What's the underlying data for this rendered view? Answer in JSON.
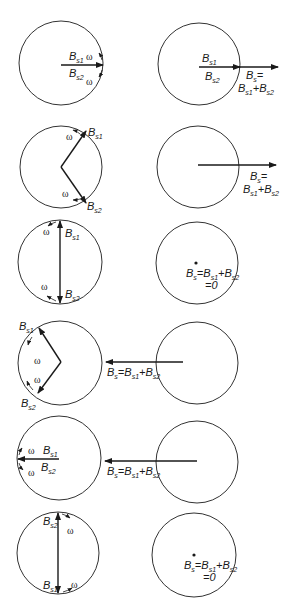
{
  "figure": {
    "labels": {
      "b": "B",
      "s": "s",
      "s1": "s1",
      "s2": "s2",
      "plus": "+",
      "eq": "=",
      "zero": "=0",
      "omega": "ω"
    },
    "rows": [
      {
        "index": 1,
        "left_state": "Bs1 and Bs2 both pointing right",
        "right_state": "Bs = Bs1 + Bs2 maximum, pointing right"
      },
      {
        "index": 2,
        "left_state": "Bs1 rotated up-right, Bs2 rotated down-right",
        "right_state": "Bs = Bs1 + Bs2 reduced, pointing right"
      },
      {
        "index": 3,
        "left_state": "Bs1 up, Bs2 down",
        "right_state": "Bs = Bs1 + Bs2 = 0"
      },
      {
        "index": 4,
        "left_state": "Bs1 up-left, Bs2 down-left",
        "right_state": "Bs = Bs1 + Bs2 pointing left"
      },
      {
        "index": 5,
        "left_state": "Bs1 and Bs2 both pointing left",
        "right_state": "Bs = Bs1 + Bs2 maximum, pointing left"
      },
      {
        "index": 6,
        "left_state": "Bs2 up, Bs1 down",
        "right_state": "Bs = Bs1 + Bs2 = 0"
      }
    ]
  }
}
